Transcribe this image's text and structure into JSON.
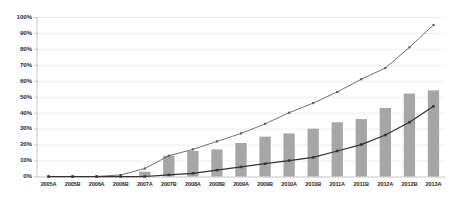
{
  "chart_data": {
    "type": "bar",
    "title": "",
    "subtitle": "",
    "xlabel": "",
    "ylabel": "",
    "ylim": [
      0,
      100
    ],
    "ytick_labels": [
      "0%",
      "10%",
      "20%",
      "30%",
      "40%",
      "50%",
      "60%",
      "70%",
      "80%",
      "90%",
      "100%"
    ],
    "ytick_values": [
      0,
      10,
      20,
      30,
      40,
      50,
      60,
      70,
      80,
      90,
      100
    ],
    "grid": "horizontal",
    "legend": "none",
    "categories": [
      "2005A",
      "2005B",
      "2006A",
      "2006B",
      "2007A",
      "2007B",
      "2008A",
      "2008B",
      "2009A",
      "2009B",
      "2010A",
      "2010B",
      "2011A",
      "2011B",
      "2012A",
      "2012B",
      "2013A"
    ],
    "series": [
      {
        "name": "bars",
        "type": "bar",
        "color": "#a6a6a6",
        "values": [
          0,
          0,
          0,
          0,
          3,
          13,
          16,
          17,
          21,
          25,
          27,
          30,
          34,
          36,
          43,
          52,
          54
        ]
      },
      {
        "name": "upper-line",
        "type": "line",
        "color": "#595959",
        "marker": "square",
        "values": [
          0,
          0,
          0,
          1,
          5,
          13,
          17,
          22,
          27,
          33,
          40,
          46,
          53,
          61,
          68,
          81,
          95
        ]
      },
      {
        "name": "lower-line",
        "type": "line",
        "color": "#333333",
        "marker": "square",
        "values": [
          0,
          0,
          0,
          0,
          0,
          1,
          2,
          4,
          6,
          8,
          10,
          12,
          16,
          20,
          26,
          34,
          44
        ]
      }
    ]
  },
  "axes": {
    "axis_line_color": "#bfbfbf",
    "gridline_color": "#e8e8e8"
  }
}
